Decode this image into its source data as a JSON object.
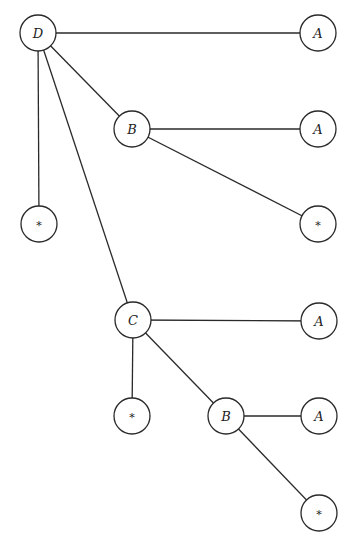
{
  "diagram": {
    "type": "tree",
    "colors": {
      "stroke": "#2a2a2a",
      "background": "#ffffff",
      "text": "#222222"
    },
    "node_radius": 18,
    "nodes": [
      {
        "id": "n1",
        "label": "D",
        "x": 38,
        "y": 33
      },
      {
        "id": "n2",
        "label": "A",
        "x": 318,
        "y": 33
      },
      {
        "id": "n3",
        "label": "B",
        "x": 132,
        "y": 129
      },
      {
        "id": "n4",
        "label": "A",
        "x": 318,
        "y": 129
      },
      {
        "id": "n5",
        "label": "*",
        "x": 39,
        "y": 224
      },
      {
        "id": "n6",
        "label": "*",
        "x": 318,
        "y": 224
      },
      {
        "id": "n7",
        "label": "C",
        "x": 133,
        "y": 320
      },
      {
        "id": "n8",
        "label": "A",
        "x": 319,
        "y": 321
      },
      {
        "id": "n9",
        "label": "*",
        "x": 132,
        "y": 416
      },
      {
        "id": "n10",
        "label": "B",
        "x": 226,
        "y": 416
      },
      {
        "id": "n11",
        "label": "A",
        "x": 319,
        "y": 416
      },
      {
        "id": "n12",
        "label": "*",
        "x": 319,
        "y": 513
      }
    ],
    "edges": [
      {
        "from": "n1",
        "to": "n2"
      },
      {
        "from": "n1",
        "to": "n3"
      },
      {
        "from": "n1",
        "to": "n5"
      },
      {
        "from": "n1",
        "to": "n7"
      },
      {
        "from": "n3",
        "to": "n4"
      },
      {
        "from": "n3",
        "to": "n6"
      },
      {
        "from": "n7",
        "to": "n8"
      },
      {
        "from": "n7",
        "to": "n9"
      },
      {
        "from": "n7",
        "to": "n10"
      },
      {
        "from": "n10",
        "to": "n11"
      },
      {
        "from": "n10",
        "to": "n12"
      }
    ]
  }
}
